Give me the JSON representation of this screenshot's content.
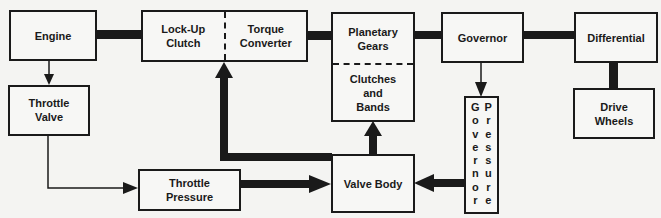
{
  "diagram": {
    "title": "",
    "colors": {
      "line": "#1a1a1a",
      "background": "#f4f4f2"
    },
    "boxes": {
      "engine": {
        "label": "Engine"
      },
      "throttle_valve": {
        "label_1": "Throttle",
        "label_2": "Valve"
      },
      "lockup_clutch": {
        "label_1": "Lock-Up",
        "label_2": "Clutch"
      },
      "torque_converter": {
        "label_1": "Torque",
        "label_2": "Converter"
      },
      "planetary_gears": {
        "label_1": "Planetary",
        "label_2": "Gears"
      },
      "clutches_bands": {
        "label_1": "Clutches",
        "label_2": "and",
        "label_3": "Bands"
      },
      "governor": {
        "label": "Governor"
      },
      "differential": {
        "label": "Differential"
      },
      "drive_wheels": {
        "label_1": "Drive",
        "label_2": "Wheels"
      },
      "throttle_pressure": {
        "label_1": "Throttle",
        "label_2": "Pressure"
      },
      "valve_body": {
        "label": "Valve Body"
      },
      "governor_pressure": {
        "col_1": [
          "G",
          "o",
          "v",
          "e",
          "r",
          "n",
          "o",
          "r"
        ],
        "col_2": [
          "P",
          "r",
          "e",
          "s",
          "s",
          "u",
          "r",
          "e"
        ]
      }
    },
    "connections": [
      {
        "from": "Engine",
        "to": "Lock-Up Clutch",
        "style": "thick"
      },
      {
        "from": "Torque Converter",
        "to": "Planetary Gears",
        "style": "thick"
      },
      {
        "from": "Planetary Gears",
        "to": "Governor",
        "style": "thick"
      },
      {
        "from": "Governor",
        "to": "Differential",
        "style": "thick"
      },
      {
        "from": "Differential",
        "to": "Drive Wheels",
        "style": "thick"
      },
      {
        "from": "Engine",
        "to": "Throttle Valve",
        "style": "thin-arrow"
      },
      {
        "from": "Throttle Valve",
        "to": "Throttle Pressure",
        "style": "thin-arrow"
      },
      {
        "from": "Throttle Pressure",
        "to": "Valve Body",
        "style": "thick-arrow"
      },
      {
        "from": "Governor",
        "to": "Governor Pressure",
        "style": "thin-arrow"
      },
      {
        "from": "Governor Pressure",
        "to": "Valve Body",
        "style": "thick-arrow"
      },
      {
        "from": "Valve Body",
        "to": "Clutches and Bands",
        "style": "thick-arrow"
      },
      {
        "from": "Valve Body",
        "to": "Lock-Up Clutch / Torque Converter",
        "style": "thick-arrow"
      }
    ]
  }
}
